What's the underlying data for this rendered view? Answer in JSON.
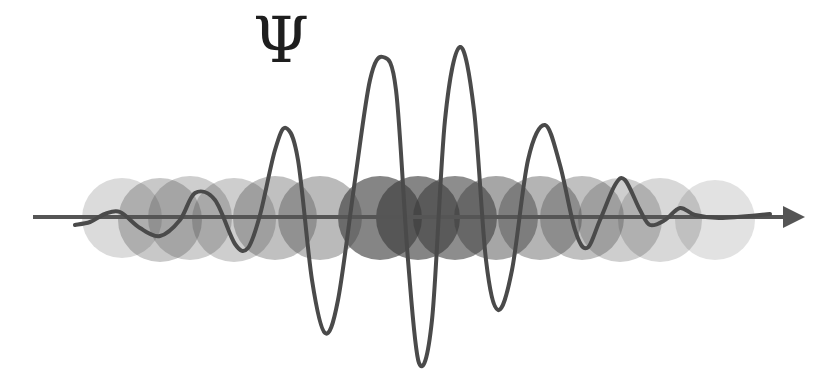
{
  "title": {
    "symbol": "Ψ"
  },
  "colors": {
    "background": "#ffffff",
    "wave": "#4a4a4a",
    "axis": "#555555",
    "circle": "#3a3a3a"
  },
  "axis": {
    "y": 217,
    "x_start": 33,
    "x_end": 805
  },
  "circles": [
    {
      "cx": 122,
      "cy": 218,
      "r": 40,
      "opacity": 0.18
    },
    {
      "cx": 160,
      "cy": 220,
      "r": 42,
      "opacity": 0.28
    },
    {
      "cx": 190,
      "cy": 218,
      "r": 42,
      "opacity": 0.25
    },
    {
      "cx": 234,
      "cy": 220,
      "r": 42,
      "opacity": 0.25
    },
    {
      "cx": 275,
      "cy": 218,
      "r": 42,
      "opacity": 0.32
    },
    {
      "cx": 320,
      "cy": 218,
      "r": 42,
      "opacity": 0.35
    },
    {
      "cx": 380,
      "cy": 218,
      "r": 42,
      "opacity": 0.62
    },
    {
      "cx": 418,
      "cy": 218,
      "r": 42,
      "opacity": 0.62
    },
    {
      "cx": 455,
      "cy": 218,
      "r": 42,
      "opacity": 0.58
    },
    {
      "cx": 496,
      "cy": 218,
      "r": 42,
      "opacity": 0.45
    },
    {
      "cx": 540,
      "cy": 218,
      "r": 42,
      "opacity": 0.38
    },
    {
      "cx": 582,
      "cy": 218,
      "r": 42,
      "opacity": 0.32
    },
    {
      "cx": 620,
      "cy": 220,
      "r": 42,
      "opacity": 0.25
    },
    {
      "cx": 660,
      "cy": 220,
      "r": 42,
      "opacity": 0.2
    },
    {
      "cx": 715,
      "cy": 220,
      "r": 40,
      "opacity": 0.15
    }
  ],
  "wave_points": [
    [
      75,
      225
    ],
    [
      90,
      222
    ],
    [
      105,
      214
    ],
    [
      120,
      212
    ],
    [
      140,
      228
    ],
    [
      160,
      236
    ],
    [
      180,
      220
    ],
    [
      195,
      193
    ],
    [
      215,
      200
    ],
    [
      235,
      244
    ],
    [
      248,
      248
    ],
    [
      260,
      215
    ],
    [
      275,
      150
    ],
    [
      286,
      128
    ],
    [
      298,
      160
    ],
    [
      312,
      280
    ],
    [
      325,
      333
    ],
    [
      338,
      300
    ],
    [
      355,
      180
    ],
    [
      370,
      80
    ],
    [
      383,
      57
    ],
    [
      396,
      90
    ],
    [
      408,
      260
    ],
    [
      419,
      363
    ],
    [
      432,
      320
    ],
    [
      445,
      120
    ],
    [
      460,
      47
    ],
    [
      474,
      110
    ],
    [
      486,
      260
    ],
    [
      498,
      310
    ],
    [
      512,
      270
    ],
    [
      528,
      160
    ],
    [
      545,
      125
    ],
    [
      560,
      165
    ],
    [
      575,
      230
    ],
    [
      587,
      248
    ],
    [
      600,
      220
    ],
    [
      615,
      185
    ],
    [
      625,
      180
    ],
    [
      640,
      210
    ],
    [
      650,
      225
    ],
    [
      665,
      220
    ],
    [
      680,
      208
    ],
    [
      695,
      215
    ],
    [
      720,
      218
    ],
    [
      770,
      214
    ]
  ]
}
